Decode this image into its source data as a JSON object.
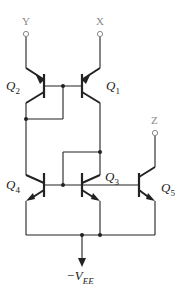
{
  "diagram": {
    "type": "circuit-schematic",
    "terminals": [
      {
        "id": "Y",
        "label": "Y"
      },
      {
        "id": "X",
        "label": "X"
      },
      {
        "id": "Z",
        "label": "Z"
      }
    ],
    "transistors": [
      {
        "id": "Q2",
        "name": "Q",
        "sub": "2",
        "type": "pnp"
      },
      {
        "id": "Q1",
        "name": "Q",
        "sub": "1",
        "type": "pnp"
      },
      {
        "id": "Q4",
        "name": "Q",
        "sub": "4",
        "type": "npn"
      },
      {
        "id": "Q3",
        "name": "Q",
        "sub": "3",
        "type": "npn"
      },
      {
        "id": "Q5",
        "name": "Q",
        "sub": "5",
        "type": "npn"
      }
    ],
    "supply": {
      "label_prefix": "−V",
      "label_sub": "EE"
    },
    "colors": {
      "wire": "#222222",
      "terminal_label": "#888888",
      "background": "#ffffff"
    }
  }
}
